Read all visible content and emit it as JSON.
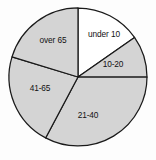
{
  "chart_data": {
    "type": "pie",
    "title": "",
    "subtitle": "",
    "xlabel": "",
    "ylabel": "",
    "legend": "none",
    "grid": false,
    "labels_inside_slices": true,
    "start_angle_deg": 0,
    "direction": "clockwise",
    "categories": [
      "under 10",
      "10-20",
      "21-40",
      "41-65",
      "over 65"
    ],
    "values": [
      15.3,
      9.7,
      32.8,
      21.9,
      20.3
    ],
    "angles_deg": [
      55,
      35,
      118,
      79,
      73
    ],
    "slice_boundaries_deg": [
      0,
      55,
      90,
      208,
      287,
      360
    ],
    "colors": [
      "#ffffff",
      "#d4d4d4",
      "#d4d4d4",
      "#d4d4d4",
      "#d4d4d4"
    ],
    "slices": [
      {
        "label": "under 10",
        "value": 15.3,
        "start_deg": 0,
        "end_deg": 55,
        "sweep_deg": 55,
        "fill": "#ffffff",
        "label_x": 104,
        "label_y": 35
      },
      {
        "label": "10-20",
        "value": 9.7,
        "start_deg": 55,
        "end_deg": 90,
        "sweep_deg": 35,
        "fill": "#d4d4d4",
        "label_x": 113,
        "label_y": 65
      },
      {
        "label": "21-40",
        "value": 32.8,
        "start_deg": 90,
        "end_deg": 208,
        "sweep_deg": 118,
        "fill": "#d4d4d4",
        "label_x": 88,
        "label_y": 116
      },
      {
        "label": "41-65",
        "value": 21.9,
        "start_deg": 208,
        "end_deg": 287,
        "sweep_deg": 79,
        "fill": "#d4d4d4",
        "label_x": 40,
        "label_y": 89
      },
      {
        "label": "over 65",
        "value": 20.3,
        "start_deg": 287,
        "end_deg": 360,
        "sweep_deg": 73,
        "fill": "#d4d4d4",
        "label_x": 53,
        "label_y": 41
      }
    ],
    "geometry": {
      "center_x": 78,
      "center_y": 77,
      "radius": 69
    },
    "style": {
      "background": "#fdfdfd",
      "outline_color": "#1a1a1a",
      "outline_width": 1.25,
      "shaded_fill": "#d4d4d4",
      "empty_fill": "#ffffff",
      "label_color": "#111111"
    }
  }
}
